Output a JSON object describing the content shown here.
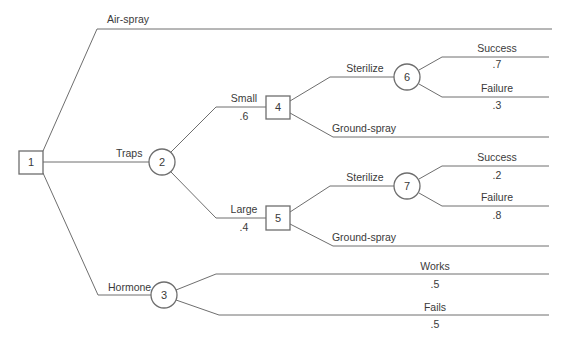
{
  "diagram": {
    "type": "decision-tree",
    "line_color": "#6e6e6e",
    "text_color": "#3a3a3a",
    "nodes": [
      {
        "id": "1",
        "label": "1",
        "shape": "decision-square"
      },
      {
        "id": "2",
        "label": "2",
        "shape": "chance-circle"
      },
      {
        "id": "3",
        "label": "3",
        "shape": "chance-circle"
      },
      {
        "id": "4",
        "label": "4",
        "shape": "decision-square"
      },
      {
        "id": "5",
        "label": "5",
        "shape": "decision-square"
      },
      {
        "id": "6",
        "label": "6",
        "shape": "chance-circle"
      },
      {
        "id": "7",
        "label": "7",
        "shape": "chance-circle"
      }
    ],
    "branches": {
      "air_spray": {
        "from": "1",
        "label": "Air-spray"
      },
      "traps": {
        "from": "1",
        "to": "2",
        "label": "Traps"
      },
      "hormone": {
        "from": "1",
        "to": "3",
        "label": "Hormone"
      },
      "small": {
        "from": "2",
        "to": "4",
        "label": "Small",
        "prob": ".6"
      },
      "large": {
        "from": "2",
        "to": "5",
        "label": "Large",
        "prob": ".4"
      },
      "sterilize_small": {
        "from": "4",
        "to": "6",
        "label": "Sterilize"
      },
      "ground_spray_small": {
        "from": "4",
        "label": "Ground-spray"
      },
      "success_6": {
        "from": "6",
        "label": "Success",
        "prob": ".7"
      },
      "failure_6": {
        "from": "6",
        "label": "Failure",
        "prob": ".3"
      },
      "sterilize_large": {
        "from": "5",
        "to": "7",
        "label": "Sterilize"
      },
      "ground_spray_large": {
        "from": "5",
        "label": "Ground-spray"
      },
      "success_7": {
        "from": "7",
        "label": "Success",
        "prob": ".2"
      },
      "failure_7": {
        "from": "7",
        "label": "Failure",
        "prob": ".8"
      },
      "works": {
        "from": "3",
        "label": "Works",
        "prob": ".5"
      },
      "fails": {
        "from": "3",
        "label": "Fails",
        "prob": ".5"
      }
    }
  }
}
